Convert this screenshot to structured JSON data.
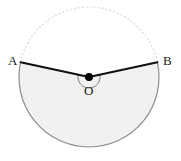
{
  "figure": {
    "kind": "circle-sector-diagram",
    "caption_points": [
      "A",
      "B",
      "O"
    ],
    "background_color": "#ffffff"
  },
  "labels": {
    "point_a": "A",
    "point_b": "B",
    "center_o": "O"
  },
  "geometry": {
    "center": {
      "x": 89,
      "y": 77
    },
    "radius": 70,
    "point_a": {
      "x": 22.6,
      "y": 61.8
    },
    "point_b": {
      "x": 155.4,
      "y": 61.8
    },
    "angle_a_degrees": 192.25,
    "angle_b_degrees": 347.75,
    "sector_sweep_degrees": 204.5,
    "angle_marker_radius": 11
  },
  "colors": {
    "sector_fill": "#f1f1f1",
    "major_arc_stroke": "#8c8c8c",
    "radius_stroke": "#111111",
    "minor_arc_dotted": "#d8d8d8",
    "center_dot": "#000000",
    "angle_marker_stroke": "#7a7a7a",
    "label_text": "#1a1a1a"
  },
  "strokes": {
    "radius_width": 2,
    "major_arc_width": 1.2,
    "minor_arc_width": 1.2,
    "minor_arc_dash": "1 3",
    "angle_marker_width": 1,
    "center_dot_radius": 4
  }
}
